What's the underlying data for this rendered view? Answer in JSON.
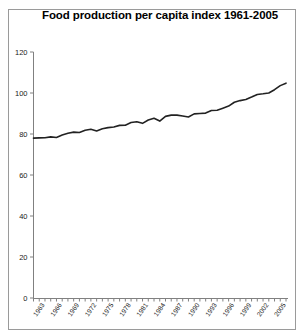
{
  "chart_data": {
    "type": "line",
    "title": "Food production per capita index 1961-2005",
    "xlabel": "",
    "ylabel": "",
    "ylim": [
      0,
      120
    ],
    "ytick_values": [
      0,
      20,
      40,
      60,
      80,
      100,
      120
    ],
    "ytick_labels": [
      "0",
      "20",
      "40",
      "60",
      "80",
      "100",
      "120"
    ],
    "xlim": [
      1961,
      2005
    ],
    "grid": false,
    "legend": "none",
    "line_color": "#222222",
    "axis_color": "#808080",
    "xtick_labels": [
      "1963",
      "1966",
      "1969",
      "1972",
      "1975",
      "1978",
      "1981",
      "1984",
      "1987",
      "1990",
      "1993",
      "1996",
      "1999",
      "2002",
      "2005"
    ],
    "xtick_label_step": 3,
    "x": [
      1961,
      1962,
      1963,
      1964,
      1965,
      1966,
      1967,
      1968,
      1969,
      1970,
      1971,
      1972,
      1973,
      1974,
      1975,
      1976,
      1977,
      1978,
      1979,
      1980,
      1981,
      1982,
      1983,
      1984,
      1985,
      1986,
      1987,
      1988,
      1989,
      1990,
      1991,
      1992,
      1993,
      1994,
      1995,
      1996,
      1997,
      1998,
      1999,
      2000,
      2001,
      2002,
      2003,
      2004,
      2005
    ],
    "values": [
      78.0,
      78.1,
      78.2,
      78.6,
      78.3,
      79.5,
      80.4,
      80.9,
      80.7,
      81.8,
      82.3,
      81.5,
      82.6,
      83.1,
      83.4,
      84.2,
      84.3,
      85.6,
      86.0,
      85.2,
      86.8,
      87.7,
      86.3,
      88.6,
      89.2,
      89.2,
      88.8,
      88.3,
      89.8,
      90.0,
      90.2,
      91.5,
      91.6,
      92.6,
      93.6,
      95.5,
      96.3,
      96.8,
      98.0,
      99.3,
      99.6,
      100.0,
      101.6,
      103.6,
      104.8
    ]
  }
}
